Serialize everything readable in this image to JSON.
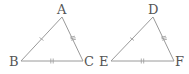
{
  "figure": {
    "triangles": [
      {
        "name": "ABC",
        "vertices": [
          {
            "label": "A",
            "x": 62,
            "y": 17
          },
          {
            "label": "B",
            "x": 21,
            "y": 61
          },
          {
            "label": "C",
            "x": 83,
            "y": 61
          }
        ],
        "tick_marks": {
          "AB": 1,
          "AC": 3,
          "BC": 2
        }
      },
      {
        "name": "DEF",
        "vertices": [
          {
            "label": "D",
            "x": 153,
            "y": 17
          },
          {
            "label": "E",
            "x": 111,
            "y": 61
          },
          {
            "label": "F",
            "x": 174,
            "y": 61
          }
        ],
        "tick_marks": {
          "DE": 1,
          "DF": 3,
          "EF": 2
        }
      }
    ],
    "colors": {
      "line": "#9a9a9a",
      "label": "#555555"
    }
  }
}
